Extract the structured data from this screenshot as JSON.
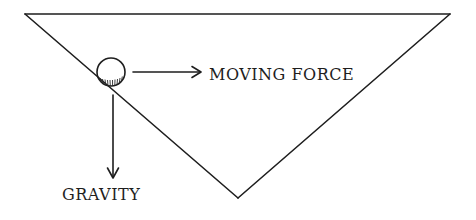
{
  "diagram": {
    "type": "physics-force-diagram",
    "shape": {
      "name": "inverted-triangle",
      "vertices": [
        [
          25,
          14
        ],
        [
          450,
          14
        ],
        [
          238,
          198
        ]
      ]
    },
    "ball": {
      "cx": 111,
      "cy": 72,
      "r": 14
    },
    "labels": {
      "moving_force": "MOVING FORCE",
      "gravity": "GRAVITY"
    },
    "arrows": [
      {
        "name": "moving-force-arrow",
        "from": [
          133,
          72
        ],
        "to": [
          200,
          72
        ],
        "direction": "right"
      },
      {
        "name": "gravity-arrow",
        "from": [
          113,
          95
        ],
        "to": [
          113,
          177
        ],
        "direction": "down"
      }
    ],
    "colors": {
      "ink": "#1e1e1e",
      "background": "#ffffff"
    }
  }
}
